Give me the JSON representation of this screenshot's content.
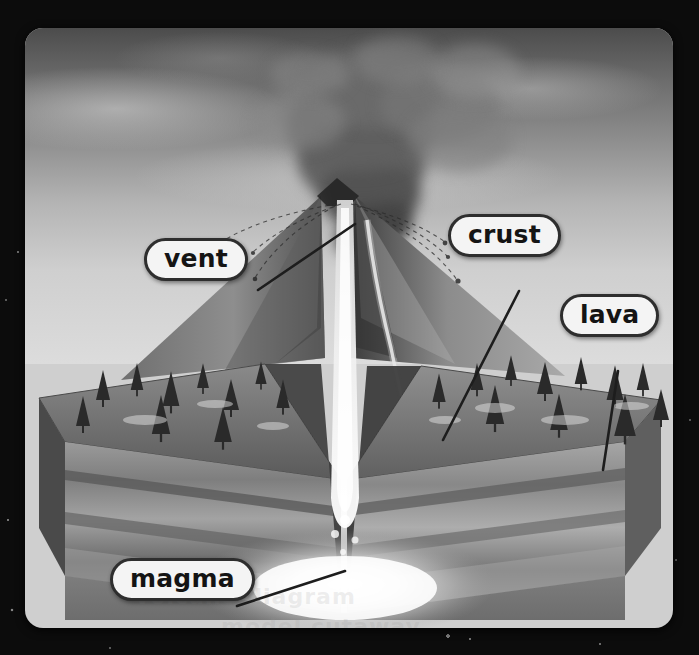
{
  "image": {
    "title": "Volcano cross-section diagram",
    "subject": "Erupting volcano cutaway model",
    "style": "grayscale photograph of a physical diorama model",
    "frame_color": "#0c0c0c",
    "panel_border_radius": "18px"
  },
  "labels": [
    {
      "id": "vent",
      "text": "vent",
      "x": 144,
      "y": 238,
      "leader": {
        "x1": 233,
        "y1": 262,
        "x2": 330,
        "y2": 196
      }
    },
    {
      "id": "crust",
      "text": "crust",
      "x": 448,
      "y": 214,
      "leader": {
        "x1": 494,
        "y1": 263,
        "x2": 418,
        "y2": 412
      }
    },
    {
      "id": "lava",
      "text": "lava",
      "x": 560,
      "y": 294,
      "leader": {
        "x1": 593,
        "y1": 343,
        "x2": 578,
        "y2": 442
      }
    },
    {
      "id": "magma",
      "text": "magma",
      "x": 110,
      "y": 558,
      "leader": {
        "x1": 212,
        "y1": 578,
        "x2": 320,
        "y2": 543
      }
    }
  ],
  "features": {
    "plume": "ash-and-steam eruption column rising from the crater",
    "ejecta": "arcing trails of volcanic bombs thrown from the vent",
    "conduit": "glowing central magma conduit rising through the cone",
    "crust_layers": [
      "surface soil with conifer trees",
      "upper rock stratum",
      "lower rock stratum",
      "dark basement rock"
    ],
    "magma_chamber": "bright molten pool beneath the volcano",
    "vegetation": "coniferous trees across both ground blocks"
  },
  "colors": {
    "label_fill": "#f4f4f4",
    "label_border": "#2e2e2e",
    "label_text": "#141414",
    "leader_line": "#1d1d1d",
    "sky_top": "#4c4c4c",
    "sky_bottom": "#dcdcdc",
    "background": "#0c0c0c"
  },
  "watermark": {
    "line1": "volcano diagram",
    "line2": "model cutaway"
  }
}
